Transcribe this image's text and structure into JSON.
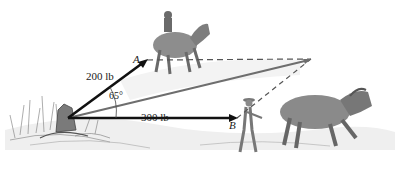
{
  "figure": {
    "forces": [
      {
        "id": "A",
        "label": "200 lb",
        "point_label": "A",
        "direction": "up-right"
      },
      {
        "id": "B",
        "label": "300 lb",
        "point_label": "B",
        "direction": "horizontal-right"
      }
    ],
    "angle_label": "65°",
    "resultant": {
      "style": "gray solid line",
      "construction": "dashed parallelogram lines"
    },
    "colors": {
      "force_line": "#111111",
      "resultant_line": "#6e6e6e",
      "dashed_line": "#555555",
      "sketch": "#8a8a8a",
      "ground": "#d9d9d9"
    }
  }
}
